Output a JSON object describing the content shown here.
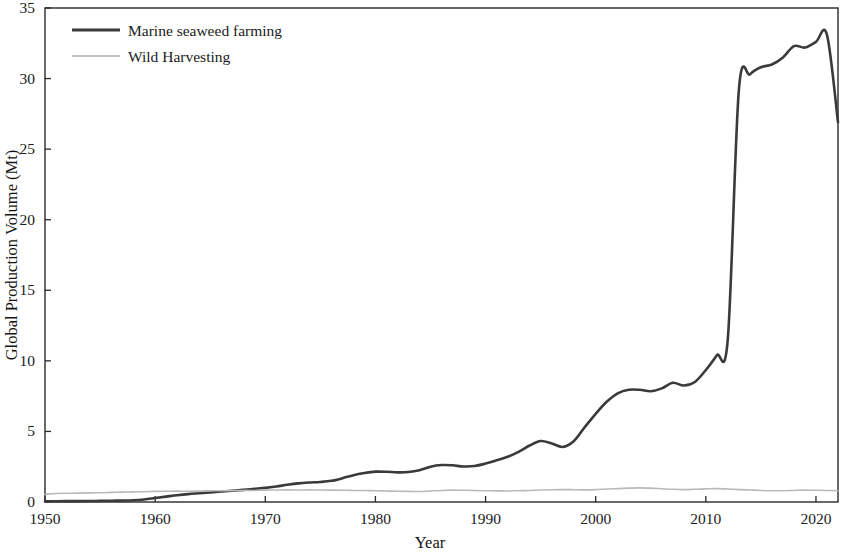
{
  "chart_data": {
    "type": "line",
    "title": "",
    "xlabel": "Year",
    "ylabel": "Global Production Volume (Mt)",
    "xlim": [
      1950,
      2022
    ],
    "ylim": [
      0,
      35
    ],
    "grid": false,
    "legend_position": "top-left",
    "x_ticks": [
      1950,
      1960,
      1970,
      1980,
      1990,
      2000,
      2010,
      2020
    ],
    "y_ticks": [
      0,
      5,
      10,
      15,
      20,
      25,
      30,
      35
    ],
    "x": [
      1950,
      1951,
      1952,
      1953,
      1954,
      1955,
      1956,
      1957,
      1958,
      1959,
      1960,
      1961,
      1962,
      1963,
      1964,
      1965,
      1966,
      1967,
      1968,
      1969,
      1970,
      1971,
      1972,
      1973,
      1974,
      1975,
      1976,
      1977,
      1978,
      1979,
      1980,
      1981,
      1982,
      1983,
      1984,
      1985,
      1986,
      1987,
      1988,
      1989,
      1990,
      1991,
      1992,
      1993,
      1994,
      1995,
      1996,
      1997,
      1998,
      1999,
      2000,
      2001,
      2002,
      2003,
      2004,
      2005,
      2006,
      2007,
      2008,
      2009,
      2010,
      2011,
      2012,
      2013,
      2014,
      2015,
      2016,
      2017,
      2018,
      2019,
      2020,
      2021,
      2022
    ],
    "series": [
      {
        "name": "Marine seaweed farming",
        "color": "#3a3a3a",
        "style": "solid",
        "width": 2.6,
        "values": [
          0.05,
          0.05,
          0.06,
          0.06,
          0.07,
          0.08,
          0.09,
          0.1,
          0.12,
          0.18,
          0.28,
          0.38,
          0.48,
          0.56,
          0.62,
          0.68,
          0.74,
          0.8,
          0.86,
          0.93,
          1.0,
          1.1,
          1.22,
          1.32,
          1.38,
          1.42,
          1.5,
          1.68,
          1.9,
          2.05,
          2.15,
          2.14,
          2.1,
          2.12,
          2.25,
          2.5,
          2.62,
          2.6,
          2.52,
          2.55,
          2.72,
          2.95,
          3.2,
          3.55,
          4.0,
          4.32,
          4.15,
          3.9,
          4.3,
          5.3,
          6.25,
          7.1,
          7.7,
          7.95,
          7.95,
          7.85,
          8.05,
          8.45,
          8.25,
          8.5,
          9.35,
          10.4,
          11.6,
          12.9,
          14.2,
          15.5,
          17.0,
          18.7,
          20.4,
          22.2,
          24.0,
          25.6,
          26.9
        ],
        "extra_points": {
          "2013": 29.2,
          "2014": 30.3,
          "2015": 30.8,
          "2016": 31.0,
          "2017": 31.5,
          "2018": 32.3,
          "2019": 32.2,
          "2020": 32.6,
          "2021": 33.1
        }
      },
      {
        "name": "Wild Harvesting",
        "color": "#b9b9b9",
        "style": "solid",
        "width": 1.6,
        "values": [
          0.55,
          0.6,
          0.62,
          0.63,
          0.65,
          0.66,
          0.68,
          0.7,
          0.72,
          0.73,
          0.75,
          0.76,
          0.77,
          0.76,
          0.78,
          0.79,
          0.8,
          0.8,
          0.82,
          0.82,
          0.84,
          0.85,
          0.86,
          0.85,
          0.86,
          0.85,
          0.84,
          0.83,
          0.82,
          0.81,
          0.8,
          0.78,
          0.76,
          0.75,
          0.74,
          0.78,
          0.82,
          0.84,
          0.83,
          0.82,
          0.8,
          0.79,
          0.78,
          0.8,
          0.82,
          0.85,
          0.87,
          0.88,
          0.87,
          0.86,
          0.88,
          0.92,
          0.95,
          0.98,
          1.0,
          0.98,
          0.94,
          0.9,
          0.88,
          0.9,
          0.93,
          0.95,
          0.92,
          0.88,
          0.85,
          0.82,
          0.8,
          0.8,
          0.82,
          0.84,
          0.83,
          0.82,
          0.8
        ]
      }
    ]
  },
  "axes": {
    "y_title": "Global Production Volume (Mt)",
    "x_title": "Year",
    "x_tick_labels": [
      "1950",
      "1960",
      "1970",
      "1980",
      "1990",
      "2000",
      "2010",
      "2020"
    ],
    "y_tick_labels": [
      "0",
      "5",
      "10",
      "15",
      "20",
      "25",
      "30",
      "35"
    ]
  },
  "legend": {
    "entries": [
      {
        "label": "Marine seaweed farming",
        "color": "#3a3a3a",
        "width": 3.2
      },
      {
        "label": "Wild Harvesting",
        "color": "#c2c2c2",
        "width": 1.8
      }
    ]
  }
}
